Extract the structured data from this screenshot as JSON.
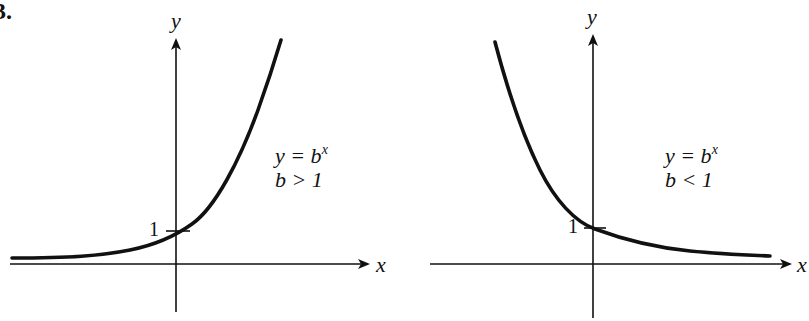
{
  "problem_label": "3.",
  "left_graph": {
    "y_axis_label": "y",
    "x_axis_label": "x",
    "intercept_label": "1",
    "equation_base": "y = b",
    "equation_exponent": "x",
    "condition": "b > 1",
    "description": "Exponential growth curve y = b^x with b > 1, passing through (0,1), approaching y=0 as x → -∞"
  },
  "right_graph": {
    "y_axis_label": "y",
    "x_axis_label": "x",
    "intercept_label": "1",
    "equation_base": "y = b",
    "equation_exponent": "x",
    "condition": "b < 1",
    "description": "Exponential decay curve y = b^x with b < 1, passing through (0,1), approaching y=0 as x → +∞"
  },
  "colors": {
    "ink": "#111111",
    "background": "#ffffff"
  }
}
